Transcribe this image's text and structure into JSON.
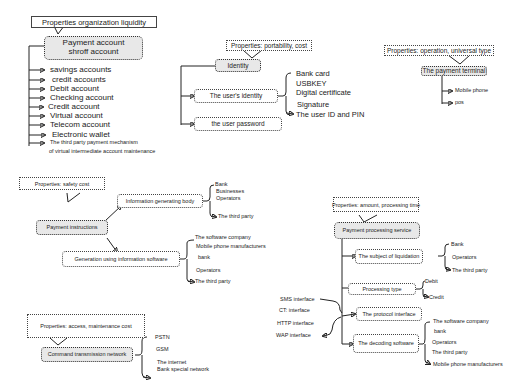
{
  "diagram": {
    "accounts": {
      "property": "Properties organization liquidity",
      "root": [
        "Payment account",
        "shroff account"
      ],
      "items": [
        "savings accounts",
        "credit accounts",
        "Debit account",
        "Checking account",
        "Credit account",
        "Virtual  account",
        "Telecom account",
        "Electronic wallet"
      ],
      "last_item": [
        "The third party payment mechanism",
        "of virtual intermediate account maintenance"
      ]
    },
    "identity": {
      "property": "Properties: portability, cost",
      "root": "Identity",
      "children": [
        "The user's identity",
        "the user password"
      ],
      "identity_items": [
        "Bank card",
        "USBKEY",
        "Digital certificate",
        "Signature",
        "The user ID and PIN"
      ]
    },
    "terminal": {
      "property": "Properties: operation, universal type",
      "root": "The payment terminal",
      "items": [
        "Mobile phone",
        "pos"
      ]
    },
    "instructions": {
      "property": "Properties: safety  cost",
      "root": "Payment instructions",
      "children": [
        "Information generating body",
        "Generation using information software"
      ],
      "body_items": [
        "Bank",
        "Businesses",
        "Operators",
        "The third party"
      ],
      "software_items": [
        "The software company",
        "Mobile phone manufacturers",
        "bank",
        "Operators",
        "The third party"
      ]
    },
    "processing": {
      "property": "Properties: amount, processing time",
      "root": "Payment processing service",
      "children": [
        "The subject of liquidation",
        "Processing type",
        "The protocol interface",
        "The decoding software"
      ],
      "liquidation_items": [
        "Bank",
        "Operators",
        "The third party"
      ],
      "type_items": [
        "Debit",
        "Credit"
      ],
      "interfaces": [
        "SMS interface",
        "CT: interface",
        "HTTP interface",
        "WAP interface"
      ],
      "decoding_items": [
        "The software company",
        "bank",
        "Operators",
        "The third party",
        "Mobile phone manufacturers"
      ]
    },
    "network": {
      "property": "Properties: access, maintenance cost",
      "root": "Command transmission network",
      "items": [
        "PSTN",
        "GSM",
        "The internet",
        "Bank special network"
      ]
    }
  }
}
